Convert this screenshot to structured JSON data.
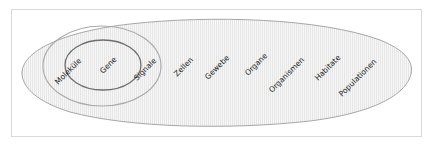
{
  "diagram": {
    "type": "nested-scales",
    "frame": {
      "stroke": "#d9d9d9"
    },
    "colors": {
      "outer_ellipse_stroke": "#9a9a9a",
      "outer_ellipse_fill": "#f6f6f6",
      "stripe": "#e4e4e4",
      "middle_circle_stroke": "#a8a8a8",
      "inner_circle_stroke": "#6a6a6a",
      "label": "#1e1e1e"
    },
    "labels": [
      {
        "text": "Moleküle"
      },
      {
        "text": "Gene"
      },
      {
        "text": "Signale"
      },
      {
        "text": "Zellen"
      },
      {
        "text": "Gewebe"
      },
      {
        "text": "Organe"
      },
      {
        "text": "Organismen"
      },
      {
        "text": "Habitate"
      },
      {
        "text": "Populationen"
      }
    ]
  }
}
